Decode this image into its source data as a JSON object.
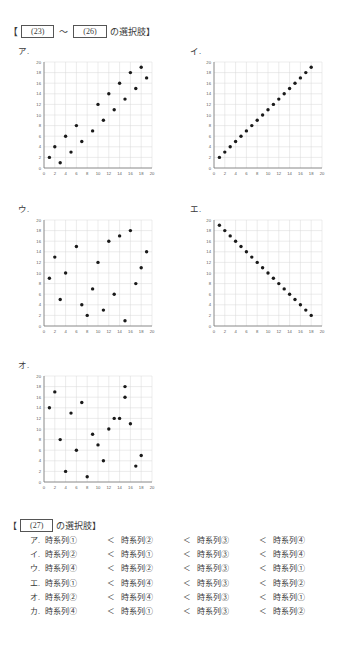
{
  "header": {
    "bracket_open": "【",
    "num_start": "(23)",
    "tilde": "～",
    "num_end": "(26)",
    "suffix": "の選択肢】"
  },
  "charts": [
    {
      "label": "ア.",
      "chart_data": {
        "type": "scatter",
        "title": "ア",
        "xlabel": "",
        "ylabel": "",
        "xlim": [
          0,
          20
        ],
        "ylim": [
          0,
          20
        ],
        "xticks": [
          0,
          2,
          4,
          6,
          8,
          10,
          12,
          14,
          16,
          18,
          20
        ],
        "yticks": [
          0,
          2,
          4,
          6,
          8,
          10,
          12,
          14,
          16,
          18,
          20
        ],
        "grid": true,
        "legend": "none",
        "x": [
          1,
          2,
          3,
          4,
          5,
          6,
          7,
          9,
          10,
          11,
          12,
          13,
          14,
          15,
          16,
          17,
          18,
          19
        ],
        "y": [
          2,
          4,
          1,
          6,
          3,
          8,
          5,
          7,
          12,
          9,
          14,
          11,
          16,
          13,
          18,
          15,
          19,
          17
        ]
      }
    },
    {
      "label": "イ.",
      "chart_data": {
        "type": "scatter",
        "title": "イ",
        "xlabel": "",
        "ylabel": "",
        "xlim": [
          0,
          20
        ],
        "ylim": [
          0,
          20
        ],
        "xticks": [
          0,
          2,
          4,
          6,
          8,
          10,
          12,
          14,
          16,
          18,
          20
        ],
        "yticks": [
          0,
          2,
          4,
          6,
          8,
          10,
          12,
          14,
          16,
          18,
          20
        ],
        "grid": true,
        "legend": "none",
        "x": [
          1,
          2,
          3,
          4,
          5,
          6,
          7,
          8,
          9,
          10,
          11,
          12,
          13,
          14,
          15,
          16,
          17,
          18
        ],
        "y": [
          2,
          3,
          4,
          5,
          6,
          7,
          8,
          9,
          10,
          11,
          12,
          13,
          14,
          15,
          16,
          17,
          18,
          19
        ]
      }
    },
    {
      "label": "ウ.",
      "chart_data": {
        "type": "scatter",
        "title": "ウ",
        "xlabel": "",
        "ylabel": "",
        "xlim": [
          0,
          20
        ],
        "ylim": [
          0,
          20
        ],
        "xticks": [
          0,
          2,
          4,
          6,
          8,
          10,
          12,
          14,
          16,
          18,
          20
        ],
        "yticks": [
          0,
          2,
          4,
          6,
          8,
          10,
          12,
          14,
          16,
          18,
          20
        ],
        "grid": true,
        "legend": "none",
        "x": [
          1,
          2,
          3,
          4,
          6,
          7,
          8,
          9,
          10,
          11,
          12,
          13,
          14,
          15,
          16,
          17,
          18,
          19
        ],
        "y": [
          9,
          13,
          5,
          10,
          15,
          4,
          2,
          7,
          12,
          3,
          16,
          6,
          17,
          1,
          18,
          8,
          11,
          14
        ]
      }
    },
    {
      "label": "エ.",
      "chart_data": {
        "type": "scatter",
        "title": "エ",
        "xlabel": "",
        "ylabel": "",
        "xlim": [
          0,
          20
        ],
        "ylim": [
          0,
          20
        ],
        "xticks": [
          0,
          2,
          4,
          6,
          8,
          10,
          12,
          14,
          16,
          18,
          20
        ],
        "yticks": [
          0,
          2,
          4,
          6,
          8,
          10,
          12,
          14,
          16,
          18,
          20
        ],
        "grid": true,
        "legend": "none",
        "x": [
          1,
          2,
          3,
          4,
          5,
          6,
          7,
          8,
          9,
          10,
          11,
          12,
          13,
          14,
          15,
          16,
          17,
          18
        ],
        "y": [
          19,
          18,
          17,
          16,
          15,
          14,
          13,
          12,
          11,
          10,
          9,
          8,
          7,
          6,
          5,
          4,
          3,
          2
        ]
      }
    },
    {
      "label": "オ.",
      "chart_data": {
        "type": "scatter",
        "title": "オ",
        "xlabel": "",
        "ylabel": "",
        "xlim": [
          0,
          20
        ],
        "ylim": [
          0,
          20
        ],
        "xticks": [
          0,
          2,
          4,
          6,
          8,
          10,
          12,
          14,
          16,
          18,
          20
        ],
        "yticks": [
          0,
          2,
          4,
          6,
          8,
          10,
          12,
          14,
          16,
          18,
          20
        ],
        "grid": true,
        "legend": "none",
        "x": [
          1,
          2,
          3,
          4,
          5,
          6,
          7,
          8,
          9,
          10,
          11,
          12,
          13,
          14,
          15,
          15,
          16,
          17,
          18
        ],
        "y": [
          14,
          17,
          8,
          2,
          13,
          6,
          15,
          1,
          9,
          7,
          4,
          10,
          12,
          12,
          16,
          18,
          11,
          3,
          5
        ]
      }
    }
  ],
  "options": {
    "bracket_open": "【",
    "num": "(27)",
    "suffix": "の選択肢】",
    "lt": "＜",
    "rows": [
      {
        "key": "ア.",
        "terms": [
          "時系列①",
          "時系列②",
          "時系列③",
          "時系列④"
        ]
      },
      {
        "key": "イ.",
        "terms": [
          "時系列②",
          "時系列①",
          "時系列③",
          "時系列④"
        ]
      },
      {
        "key": "ウ.",
        "terms": [
          "時系列④",
          "時系列②",
          "時系列③",
          "時系列①"
        ]
      },
      {
        "key": "エ.",
        "terms": [
          "時系列①",
          "時系列④",
          "時系列③",
          "時系列②"
        ]
      },
      {
        "key": "オ.",
        "terms": [
          "時系列②",
          "時系列④",
          "時系列③",
          "時系列①"
        ]
      },
      {
        "key": "カ.",
        "terms": [
          "時系列④",
          "時系列①",
          "時系列③",
          "時系列②"
        ]
      }
    ]
  }
}
